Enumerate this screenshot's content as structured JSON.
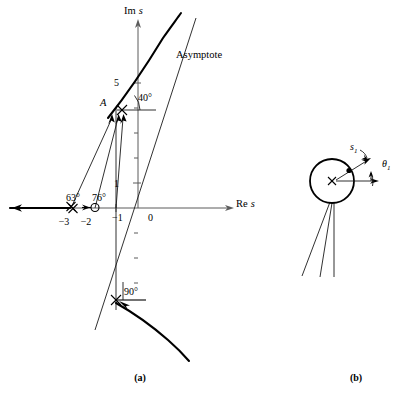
{
  "figure": {
    "panels": [
      {
        "id": "a",
        "caption": "(a)",
        "caption_x": 140,
        "caption_y": 381
      },
      {
        "id": "b",
        "caption": "(b)",
        "caption_x": 356,
        "caption_y": 381
      }
    ]
  },
  "panel_a": {
    "axes": {
      "imaginary_label": "Im",
      "imaginary_label_italic": "s",
      "imaginary_label_x": 124,
      "imaginary_label_y": 14,
      "real_label": "Re",
      "real_label_italic": "s",
      "real_label_x": 236,
      "real_label_y": 207,
      "origin_label": "0",
      "origin_x": 132,
      "origin_y": 155
    },
    "tick_labels": [
      {
        "text": "5",
        "x": 119,
        "y": 86,
        "axis": "imaginary"
      },
      {
        "text": "1",
        "x": 119,
        "y": 187,
        "axis": "imaginary"
      },
      {
        "text": "0",
        "x": 148,
        "y": 221,
        "axis": "origin"
      },
      {
        "text": "−1",
        "x": 121,
        "y": 221,
        "axis": "real"
      },
      {
        "text": "−2",
        "x": 86,
        "y": 225,
        "axis": "real"
      },
      {
        "text": "−3",
        "x": 62,
        "y": 225,
        "axis": "real"
      }
    ],
    "angle_labels": [
      {
        "text": "40°",
        "x": 138,
        "y": 101
      },
      {
        "text": "63°",
        "x": 72,
        "y": 201
      },
      {
        "text": "76°",
        "x": 97,
        "y": 201
      },
      {
        "text": "90°",
        "x": 122,
        "y": 295
      }
    ],
    "point_labels": [
      {
        "text": "A",
        "x": 103,
        "y": 105
      }
    ],
    "annotations": [
      {
        "text": "Asymptote",
        "x": 176,
        "y": 58
      }
    ],
    "markers": {
      "complex_pole_upper": {
        "x": 122,
        "y": 110,
        "type": "x-cross"
      },
      "complex_pole_lower": {
        "x": 116,
        "y": 300,
        "type": "x-cross"
      },
      "real_double_pole": {
        "x": 71,
        "y": 208,
        "type": "x-cross-double",
        "value": -3
      },
      "real_zero": {
        "x": 95,
        "y": 208,
        "type": "open-circle",
        "value": -2
      }
    }
  },
  "panel_b": {
    "symbols": [
      {
        "text": "s",
        "sub": "1",
        "x": 356,
        "y": 152
      },
      {
        "text": "θ",
        "sub": "1",
        "x": 387,
        "y": 165
      }
    ],
    "pole_marker": {
      "x": 332,
      "y": 181,
      "type": "x-cross"
    },
    "circle": {
      "cx": 332,
      "cy": 181,
      "r": 22
    }
  },
  "colors": {
    "axis": "#5b5b5b",
    "locus": "#000000",
    "construction": "#1a1a1a",
    "background": "#ffffff"
  }
}
